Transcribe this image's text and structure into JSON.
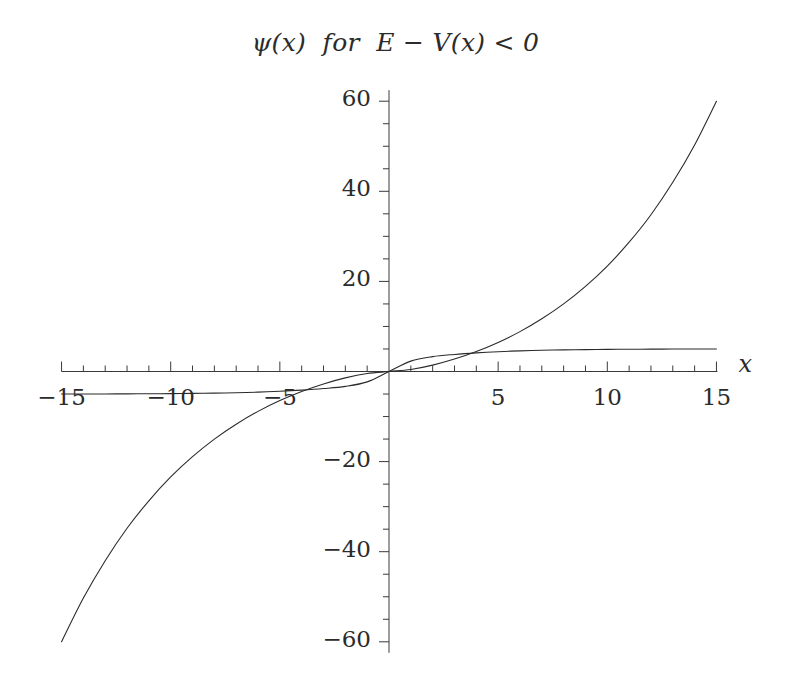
{
  "figure": {
    "title": "ψ(x)  for  E − V(x) < 0",
    "background_color": "#ffffff",
    "curve_color": "#2b2b2b",
    "axis_color": "#3a3a3a"
  },
  "axes": {
    "x_axis_name": "x",
    "y_axis_name": "",
    "x_tick_labels": [
      "-15",
      "-10",
      "-5",
      "5",
      "10",
      "15"
    ],
    "x_tick_values": [
      -15,
      -10,
      -5,
      5,
      10,
      15
    ],
    "y_tick_labels": [
      "60",
      "40",
      "20",
      "-20",
      "-40",
      "-60"
    ],
    "y_tick_values": [
      60,
      40,
      20,
      -20,
      -40,
      -60
    ],
    "minor_tick_step_x": 1,
    "minor_tick_step_y": 5
  },
  "chart_data": {
    "type": "line",
    "title": "ψ(x)  for  E − V(x) < 0",
    "xlabel": "x",
    "ylabel": "",
    "xlim": [
      -15,
      15
    ],
    "ylim": [
      -62,
      62
    ],
    "grid": false,
    "legend": "none",
    "x": [
      -15,
      -14,
      -13,
      -12,
      -11,
      -10,
      -9,
      -8,
      -7,
      -6,
      -5,
      -4,
      -3,
      -2,
      -1,
      0,
      1,
      2,
      3,
      4,
      5,
      6,
      7,
      8,
      9,
      10,
      11,
      12,
      13,
      14,
      15
    ],
    "series": [
      {
        "name": "growing-exponential-solution",
        "description": "odd, exponentially growing solution; reaches about +60 at x=15 and -60 at x=-15",
        "values": [
          -60.0,
          -50.3,
          -42.0,
          -34.8,
          -28.7,
          -23.4,
          -18.9,
          -15.0,
          -11.7,
          -8.85,
          -6.45,
          -4.43,
          -2.76,
          -1.42,
          -0.46,
          0.0,
          0.46,
          1.42,
          2.76,
          4.43,
          6.45,
          8.85,
          11.7,
          15.0,
          18.9,
          23.4,
          28.7,
          34.8,
          42.0,
          50.3,
          60.0
        ]
      },
      {
        "name": "decaying-saturating-solution",
        "description": "odd, saturating solution approaching about +5 for large positive x and -5 for large negative x",
        "values": [
          -5.0,
          -4.99,
          -4.98,
          -4.96,
          -4.94,
          -4.91,
          -4.86,
          -4.8,
          -4.71,
          -4.58,
          -4.4,
          -4.14,
          -3.79,
          -3.3,
          -2.3,
          0.0,
          2.3,
          3.3,
          3.79,
          4.14,
          4.4,
          4.58,
          4.71,
          4.8,
          4.86,
          4.91,
          4.94,
          4.96,
          4.98,
          4.99,
          5.0
        ]
      }
    ]
  }
}
